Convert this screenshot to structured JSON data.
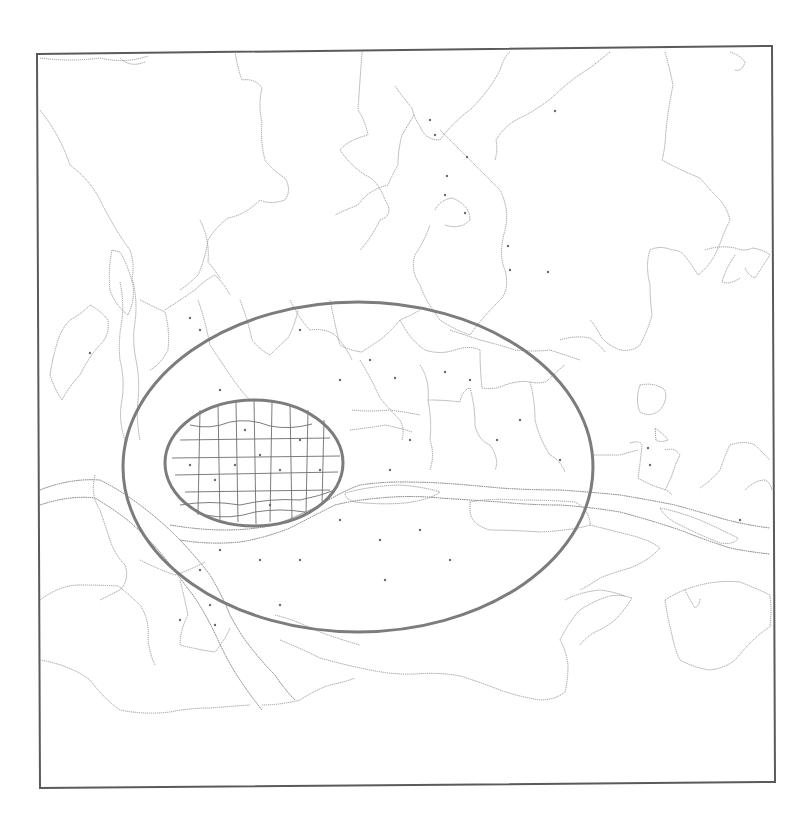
{
  "map": {
    "width": 809,
    "height": 816,
    "frame": {
      "x1": 37,
      "y1": 50,
      "x2": 774,
      "y2": 784
    },
    "colors": {
      "background": "#ffffff",
      "frame": "#5a5a5a",
      "boundary": "#9a9a9a",
      "ring": "#7c7c7c",
      "dot": "#6a6a6a"
    },
    "rings": [
      {
        "name": "outer-ring",
        "cx": 358,
        "cy": 467,
        "rx": 235,
        "ry": 165
      },
      {
        "name": "inner-ring",
        "cx": 254,
        "cy": 463,
        "rx": 89,
        "ry": 63
      }
    ],
    "legend": null,
    "labels": []
  }
}
